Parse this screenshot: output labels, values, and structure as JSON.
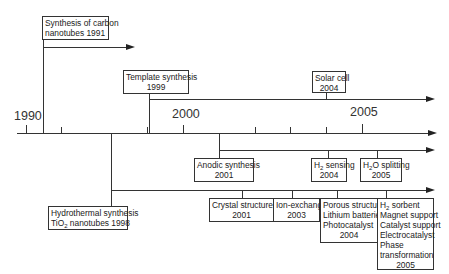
{
  "diagram": {
    "type": "timeline",
    "axis": {
      "start_label": "1990",
      "mid_label": "2000",
      "end_label": "2005",
      "tick_years": [
        1990,
        1991,
        1992,
        1995,
        1998,
        1999,
        2000,
        2001,
        2002,
        2003,
        2004,
        2005
      ]
    },
    "events": {
      "carbon": {
        "line1": "Synthesis of carbon",
        "line2": "nanotubes 1991"
      },
      "template": {
        "line1": "Template synthesis",
        "line2": "1999"
      },
      "solar": {
        "line1": "Solar cell",
        "line2": "2004"
      },
      "anodic": {
        "line1": "Anodic synthesis",
        "line2": "2001"
      },
      "h2sensing": {
        "pre": "H",
        "sub": "2",
        "post": " sensing",
        "line2": "2004"
      },
      "h2osplitting": {
        "pre": "H",
        "sub": "2",
        "post": "O splitting",
        "line2": "2005"
      },
      "hydrothermal": {
        "line1": "Hydrothermal synthesis",
        "pre": "TiO",
        "sub": "2",
        "post": " nanotubes 1998"
      },
      "crystal": {
        "line1": "Crystal structure",
        "line2": "2001"
      },
      "ionexchange": {
        "line1": "Ion-exchange",
        "line2": "2003"
      },
      "porous": {
        "line1": "Porous structure",
        "line2": "Lithium batteries",
        "line3": "Photocatalyst",
        "line4": "2004"
      },
      "sorbent": {
        "pre": "H",
        "sub": "2",
        "post": " sorbent",
        "line2": "Magnet support",
        "line3": "Catalyst support",
        "line4": "Electrocatalyst",
        "line5": "Phase",
        "line6": "transformation",
        "line7": "2005"
      }
    }
  }
}
